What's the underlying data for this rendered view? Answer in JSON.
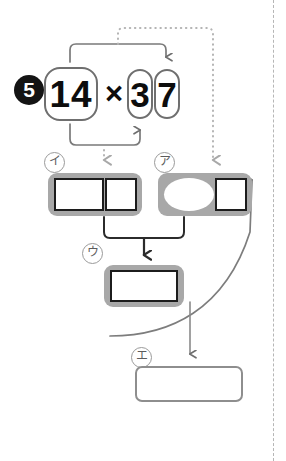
{
  "worksheet": {
    "problem_number": "5",
    "equation": {
      "multiplicand": "14",
      "operator": "×",
      "multiplier_tens": "3",
      "multiplier_ones": "7"
    },
    "labels": {
      "a": "ア",
      "i": "イ",
      "u": "ウ",
      "e": "エ"
    },
    "slots": {
      "i_left": "",
      "i_right": "",
      "a_oval": "",
      "a_right": "",
      "u_box": "",
      "e_box": ""
    }
  },
  "colors": {
    "shell_gray": "#a8a8a8",
    "cell_border": "#1c1c1c",
    "connector_solid": "#7a7a7a",
    "connector_dotted": "#b0b0b0",
    "bullet_fill": "#141414",
    "cut_rule": "#b6b6b6"
  }
}
